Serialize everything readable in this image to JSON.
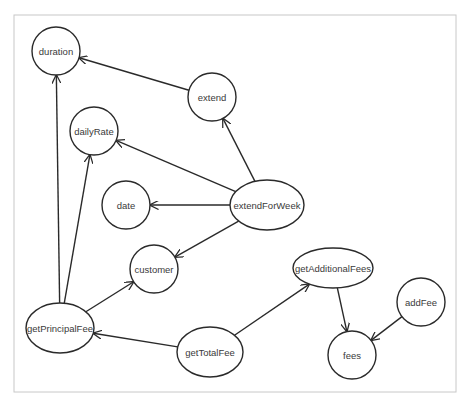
{
  "diagram": {
    "type": "dependency-graph",
    "frame": {
      "x": 14,
      "y": 15,
      "width": 442,
      "height": 377
    },
    "nodes": [
      {
        "id": "duration",
        "label": "duration",
        "shape": "circle",
        "cx": 56,
        "cy": 51,
        "rx": 24,
        "ry": 24
      },
      {
        "id": "extend",
        "label": "extend",
        "shape": "circle",
        "cx": 212,
        "cy": 97,
        "rx": 24,
        "ry": 24
      },
      {
        "id": "dailyRate",
        "label": "dailyRate",
        "shape": "circle",
        "cx": 94,
        "cy": 131,
        "rx": 24,
        "ry": 24
      },
      {
        "id": "date",
        "label": "date",
        "shape": "circle",
        "cx": 126,
        "cy": 205,
        "rx": 24,
        "ry": 24
      },
      {
        "id": "extendForWeek",
        "label": "extendForWeek",
        "shape": "ellipse",
        "cx": 267,
        "cy": 205,
        "rx": 37,
        "ry": 25
      },
      {
        "id": "customer",
        "label": "customer",
        "shape": "circle",
        "cx": 154,
        "cy": 269,
        "rx": 24,
        "ry": 24
      },
      {
        "id": "getPrincipalFee",
        "label": "getPrincipalFee",
        "shape": "ellipse",
        "cx": 60,
        "cy": 328,
        "rx": 34,
        "ry": 25
      },
      {
        "id": "getTotalFee",
        "label": "getTotalFee",
        "shape": "ellipse",
        "cx": 210,
        "cy": 352,
        "rx": 33,
        "ry": 25
      },
      {
        "id": "getAdditionalFees",
        "label": "getAdditionalFees",
        "shape": "ellipse",
        "cx": 333,
        "cy": 268,
        "rx": 40,
        "ry": 20
      },
      {
        "id": "addFee",
        "label": "addFee",
        "shape": "circle",
        "cx": 421,
        "cy": 302,
        "rx": 24,
        "ry": 24
      },
      {
        "id": "fees",
        "label": "fees",
        "shape": "circle",
        "cx": 352,
        "cy": 355,
        "rx": 24,
        "ry": 24
      }
    ],
    "edges": [
      {
        "from": "extend",
        "to": "duration"
      },
      {
        "from": "extendForWeek",
        "to": "extend"
      },
      {
        "from": "extendForWeek",
        "to": "dailyRate"
      },
      {
        "from": "extendForWeek",
        "to": "date"
      },
      {
        "from": "extendForWeek",
        "to": "customer"
      },
      {
        "from": "getPrincipalFee",
        "to": "duration"
      },
      {
        "from": "getPrincipalFee",
        "to": "dailyRate"
      },
      {
        "from": "getPrincipalFee",
        "to": "customer"
      },
      {
        "from": "getTotalFee",
        "to": "getPrincipalFee"
      },
      {
        "from": "getTotalFee",
        "to": "getAdditionalFees"
      },
      {
        "from": "getAdditionalFees",
        "to": "fees"
      },
      {
        "from": "addFee",
        "to": "fees"
      }
    ],
    "colors": {
      "stroke": "#2a2a2a",
      "text": "#3a3a3a",
      "frame": "#c8c8c8",
      "background": "#ffffff"
    }
  }
}
